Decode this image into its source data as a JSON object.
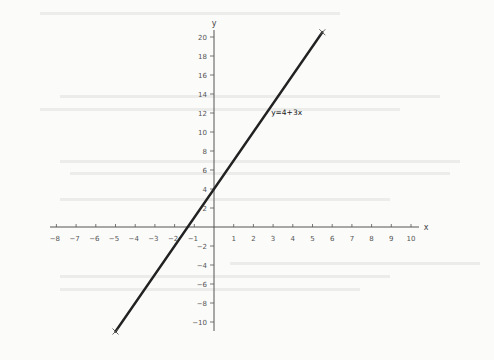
{
  "chart_data": {
    "type": "line",
    "title": "",
    "xlabel": "x",
    "ylabel": "y",
    "xlim": [
      -8,
      10
    ],
    "ylim": [
      -10,
      20
    ],
    "xticks": [
      -8,
      -7,
      -6,
      -5,
      -4,
      -3,
      -2,
      -1,
      1,
      2,
      3,
      4,
      5,
      6,
      7,
      8,
      9,
      10
    ],
    "yticks": [
      -10,
      -8,
      -6,
      -4,
      -2,
      2,
      4,
      6,
      8,
      10,
      12,
      14,
      16,
      18,
      20
    ],
    "grid": false,
    "legend": null,
    "series": [
      {
        "name": "y=4+3x",
        "equation": "y = 4 + 3x",
        "x": [
          -5,
          5.5
        ],
        "y": [
          -11,
          20.5
        ],
        "color": "#222222",
        "endpoint_marker": "x"
      }
    ],
    "annotations": [
      {
        "text": "y=4+3x",
        "x": 2.9,
        "y": 11.8
      }
    ],
    "intercepts": {
      "y_intercept": 4,
      "x_intercept": -1.333
    }
  },
  "colors": {
    "axis": "#555555",
    "line": "#222222",
    "background": "#fbfbfa"
  }
}
